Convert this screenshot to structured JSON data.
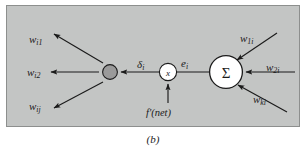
{
  "figure": {
    "caption": "(b)",
    "panel_bg": "#c3c5c4",
    "panel_border": "#8d8f8e",
    "ink": "#1b1b1b"
  },
  "diagram": {
    "type": "neural-network-backpropagation-node",
    "left_weights": [
      {
        "name": "w-i1",
        "base": "w",
        "sub": "i1"
      },
      {
        "name": "w-i2",
        "base": "w",
        "sub": "i2"
      },
      {
        "name": "w-ij",
        "base": "w",
        "sub": "ij"
      }
    ],
    "right_weights": [
      {
        "name": "w-1i",
        "base": "w",
        "sub": "1i"
      },
      {
        "name": "w-2i",
        "base": "w",
        "sub": "2i"
      },
      {
        "name": "w-ki",
        "base": "w",
        "sub": "ki"
      }
    ],
    "signals": {
      "delta": {
        "base": "δ",
        "sub": "i"
      },
      "error": {
        "base": "e",
        "sub": "i"
      },
      "derivative": "f'(net)"
    },
    "nodes": {
      "delta_node_fill": "#9a9a9a",
      "multiplier_label": "x",
      "summation_label": "Σ"
    }
  }
}
